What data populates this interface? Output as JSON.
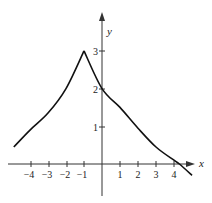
{
  "chart_data": {
    "type": "line",
    "title": "",
    "xlabel": "x",
    "ylabel": "y",
    "xlim": [
      -5,
      5.2
    ],
    "ylim": [
      -0.5,
      4
    ],
    "grid": false,
    "x_ticks": [
      -4,
      -3,
      -2,
      -1,
      1,
      2,
      3,
      4
    ],
    "x_tick_labels": [
      "−4",
      "−3",
      "−2",
      "−1",
      "1",
      "2",
      "3",
      "4"
    ],
    "y_ticks": [
      1,
      2,
      3
    ],
    "y_tick_labels": [
      "1",
      "2",
      "3"
    ],
    "annotations": [
      "cusp at (-1, 3)"
    ],
    "series": [
      {
        "name": "f(x)",
        "x": [
          -4.9,
          -4,
          -3,
          -2,
          -1,
          0,
          1,
          2,
          3,
          4,
          4.3,
          5
        ],
        "values": [
          0.45,
          0.9,
          1.35,
          2.0,
          3.0,
          2.0,
          1.5,
          0.95,
          0.45,
          0.1,
          0.0,
          -0.3
        ]
      }
    ]
  },
  "labels": {
    "x_axis": "x",
    "y_axis": "y",
    "xticks": [
      "−4",
      "−3",
      "−2",
      "−1",
      "1",
      "2",
      "3",
      "4"
    ],
    "yticks": [
      "1",
      "2",
      "3"
    ]
  }
}
